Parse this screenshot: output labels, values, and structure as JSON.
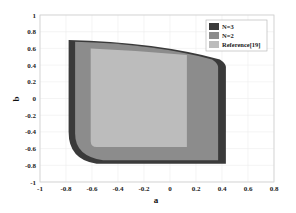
{
  "chart_data": {
    "type": "area",
    "title": "",
    "xlabel": "a",
    "ylabel": "b",
    "xlim": [
      -1,
      0.8
    ],
    "ylim": [
      -1,
      1
    ],
    "xticks": [
      -1,
      -0.8,
      -0.6,
      -0.4,
      -0.2,
      0,
      0.2,
      0.4,
      0.6,
      0.8
    ],
    "xtick_labels": [
      "-1",
      "-0.8",
      "-0.6",
      "-0.4",
      "-0.2",
      "0",
      "0.2",
      "0.4",
      "0.6",
      "0.8"
    ],
    "yticks": [
      -1,
      -0.8,
      -0.6,
      -0.4,
      -0.2,
      0,
      0.2,
      0.4,
      0.6,
      0.8,
      1
    ],
    "ytick_labels": [
      "-1",
      "-0.8",
      "-0.6",
      "-0.4",
      "-0.2",
      "0",
      "0.2",
      "0.4",
      "0.6",
      "0.8",
      "1"
    ],
    "grid": true,
    "legend_position": "upper right",
    "series": [
      {
        "name": "N=3",
        "color": "#3a3a3a",
        "region": {
          "left_x": -0.78,
          "right_x": 0.43,
          "top_left_y": 0.7,
          "top_right_y": 0.42,
          "bottom_y": -0.78,
          "left_bottom_y": -0.4
        }
      },
      {
        "name": "N=2",
        "color": "#8c8c8c",
        "region": {
          "left_x": -0.73,
          "right_x": 0.37,
          "top_left_y": 0.68,
          "top_right_y": 0.42,
          "bottom_y": -0.74,
          "left_bottom_y": -0.42
        }
      },
      {
        "name": "Reference[19]",
        "color": "#bcbcbc",
        "region": {
          "left_x": -0.61,
          "right_x": 0.13,
          "top_left_y": 0.6,
          "top_right_y": 0.52,
          "bottom_y": -0.58,
          "left_bottom_y": -0.42
        }
      }
    ]
  },
  "legend": {
    "items": [
      {
        "label": "N=3",
        "color": "#3a3a3a"
      },
      {
        "label": "N=2",
        "color": "#8c8c8c"
      },
      {
        "label": "Reference[19]",
        "color": "#bcbcbc"
      }
    ]
  }
}
